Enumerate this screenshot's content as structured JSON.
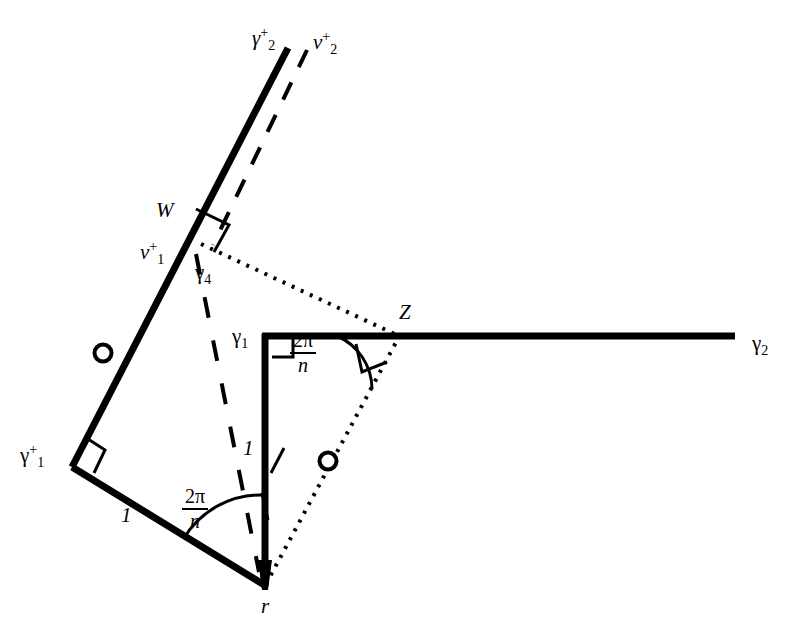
{
  "figure": {
    "background_color": "#ffffff",
    "stroke_color": "#000000",
    "width": 806,
    "height": 643
  },
  "labels": {
    "gamma2_plus": {
      "base": "γ",
      "sub": "2",
      "sup": "+",
      "x": 252,
      "y": 33
    },
    "v2_plus": {
      "base": "v",
      "sub": "2",
      "sup": "+",
      "x": 313,
      "y": 36
    },
    "W": {
      "text": "W",
      "x": 156,
      "y": 207
    },
    "v1_plus": {
      "base": "v",
      "sub": "1",
      "sup": "+",
      "x": 140,
      "y": 243
    },
    "gamma4": {
      "base": "γ",
      "sub": "4",
      "x": 195,
      "y": 268
    },
    "gamma1_corner": {
      "base": "γ",
      "sub": "1",
      "x": 235,
      "y": 327
    },
    "Z": {
      "text": "Z",
      "x": 399,
      "y": 308
    },
    "gamma2_right": {
      "base": "γ",
      "sub": "2",
      "x": 752,
      "y": 336
    },
    "gamma1_plus": {
      "base": "γ",
      "sub": "1",
      "sup": "+",
      "x": 22,
      "y": 450
    },
    "side_one_left": {
      "text": "1",
      "x": 121,
      "y": 512
    },
    "side_one_vertical": {
      "text": "1",
      "x": 243,
      "y": 445
    },
    "r": {
      "text": "r",
      "x": 261,
      "y": 603
    }
  },
  "fractions": {
    "angle_at_r": {
      "numerator": "2π",
      "denominator": "n",
      "x": 182,
      "y": 493
    },
    "angle_at_Z": {
      "numerator": "2π",
      "denominator": "n",
      "x": 290,
      "y": 335
    }
  },
  "geometry": {
    "points": {
      "gamma2_plus_end": [
        288,
        48
      ],
      "W": [
        198,
        242
      ],
      "gamma1_plus": [
        72,
        467
      ],
      "r": [
        265,
        585
      ],
      "gamma1_corner": [
        265,
        336
      ],
      "Z": [
        395,
        334
      ],
      "gamma2_right_end": [
        735,
        336
      ]
    },
    "thick_lines": [
      {
        "name": "geodesic-gamma2-plus",
        "from": [
          288,
          48
        ],
        "to": [
          72,
          467
        ]
      },
      {
        "name": "geodesic-gamma1-plus-to-r",
        "from": [
          72,
          467
        ],
        "to": [
          265,
          585
        ]
      },
      {
        "name": "vertical-side-one",
        "from": [
          265,
          336
        ],
        "to": [
          265,
          585
        ]
      },
      {
        "name": "horizontal-gamma2",
        "from": [
          265,
          336
        ],
        "to": [
          735,
          336
        ]
      }
    ],
    "dashed_lines": [
      {
        "name": "v2-plus-parallel",
        "from": [
          305,
          52
        ],
        "to": [
          212,
          243
        ]
      },
      {
        "name": "gamma4-dashed",
        "from": [
          196,
          256
        ],
        "to": [
          258,
          570
        ]
      }
    ],
    "dotted_lines": [
      {
        "name": "W-to-Z-dotted",
        "from": [
          200,
          243
        ],
        "to": [
          398,
          335
        ]
      },
      {
        "name": "r-to-Z-dotted",
        "from": [
          265,
          583
        ],
        "to": [
          400,
          337
        ]
      }
    ],
    "circle_markers": [
      {
        "name": "midpoint-marker-left",
        "cx": 103,
        "cy": 353,
        "r": 8
      },
      {
        "name": "midpoint-marker-dotted",
        "cx": 328,
        "cy": 461,
        "r": 8
      }
    ],
    "right_angle_marks": [
      {
        "name": "right-angle-at-W",
        "x": 198,
        "y": 242
      },
      {
        "name": "right-angle-at-gamma1-plus",
        "x": 72,
        "y": 467
      },
      {
        "name": "right-angle-at-gamma1-corner",
        "x": 265,
        "y": 336
      },
      {
        "name": "right-angle-at-Z",
        "x": 395,
        "y": 334
      }
    ],
    "angle_arcs": [
      {
        "name": "arc-at-r",
        "vertex": [
          265,
          585
        ],
        "radius": 88
      },
      {
        "name": "arc-at-Z",
        "vertex": [
          395,
          334
        ],
        "radius": 56
      }
    ]
  }
}
